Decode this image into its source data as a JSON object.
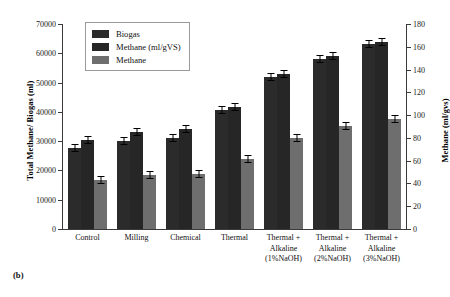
{
  "caption": "(b)",
  "legend": {
    "position": "top-left-inside",
    "items": [
      {
        "label": "Biogas",
        "color": "#2b2b2b",
        "swatch": "legend-swatch-biogas"
      },
      {
        "label": "Methane (ml/gVS)",
        "color": "#262626",
        "swatch": "legend-swatch-methane-mlgvs"
      },
      {
        "label": "Methane",
        "color": "#6e6e6e",
        "swatch": "legend-swatch-methane"
      }
    ]
  },
  "axes": {
    "y_left": {
      "label": "Total Methane/ Biogas (ml)",
      "ticks": [
        0,
        10000,
        20000,
        30000,
        40000,
        50000,
        60000,
        70000
      ],
      "min": 0,
      "max": 70000
    },
    "y_right": {
      "label": "Methane (ml/gvs)",
      "ticks": [
        0,
        20,
        40,
        60,
        80,
        100,
        120,
        140,
        160,
        180
      ],
      "min": 0,
      "max": 180
    },
    "x": {
      "categories": [
        [
          "Control"
        ],
        [
          "Milling"
        ],
        [
          "Chemical"
        ],
        [
          "Thermal"
        ],
        [
          "Thermal +",
          "Alkaline",
          "(1%NaOH)"
        ],
        [
          "Thermal +",
          "Alkaline",
          "(2%NaOH)"
        ],
        [
          "Thermal +",
          "Alkaline",
          "(3%NaOH)"
        ]
      ]
    }
  },
  "chart_data": {
    "type": "bar",
    "title": "",
    "xlabel": "",
    "ylabel": "Total Methane/ Biogas (ml)",
    "y2label": "Methane (ml/gvs)",
    "ylim": [
      0,
      70000
    ],
    "y2lim": [
      0,
      180
    ],
    "grid": false,
    "legend_position": "upper left",
    "categories": [
      "Control",
      "Milling",
      "Chemical",
      "Thermal",
      "Thermal + Alkaline (1%NaOH)",
      "Thermal + Alkaline (2%NaOH)",
      "Thermal + Alkaline (3%NaOH)"
    ],
    "series": [
      {
        "name": "Biogas",
        "axis": "left",
        "unit": "ml",
        "color": "#2b2b2b",
        "values": [
          27800,
          30000,
          31000,
          40500,
          52000,
          58200,
          63200
        ],
        "errors": [
          700,
          700,
          700,
          800,
          900,
          900,
          900
        ]
      },
      {
        "name": "Methane (ml/gVS)",
        "axis": "left",
        "unit": "ml",
        "color": "#262626",
        "values": [
          30500,
          33000,
          34300,
          41500,
          53000,
          59000,
          64000
        ],
        "errors": [
          700,
          800,
          800,
          800,
          900,
          900,
          900
        ]
      },
      {
        "name": "Methane",
        "axis": "right",
        "unit": "ml/gVS",
        "color": "#6e6e6e",
        "values_left_scale": [
          16800,
          18500,
          18800,
          24000,
          31200,
          35200,
          37700
        ],
        "values": [
          43,
          48,
          48,
          62,
          80,
          90,
          97
        ],
        "errors": [
          2,
          2,
          2,
          2,
          2,
          2,
          2
        ]
      }
    ]
  }
}
